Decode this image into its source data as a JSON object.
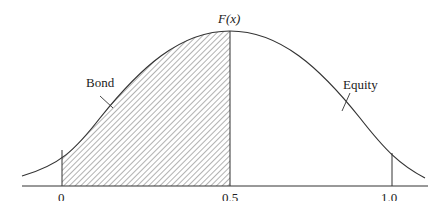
{
  "diagram": {
    "function_label": "F(x)",
    "regions": [
      {
        "name": "Bond",
        "label": "Bond",
        "shaded": true,
        "x_range": [
          0,
          0.5
        ]
      },
      {
        "name": "Equity",
        "label": "Equity",
        "shaded": false,
        "x_range": [
          0.5,
          1.0
        ]
      }
    ],
    "x_ticks": [
      "0",
      "0.5",
      "1.0"
    ],
    "colors": {
      "line": "#333333",
      "hatch": "#555555",
      "background": "#ffffff"
    }
  }
}
